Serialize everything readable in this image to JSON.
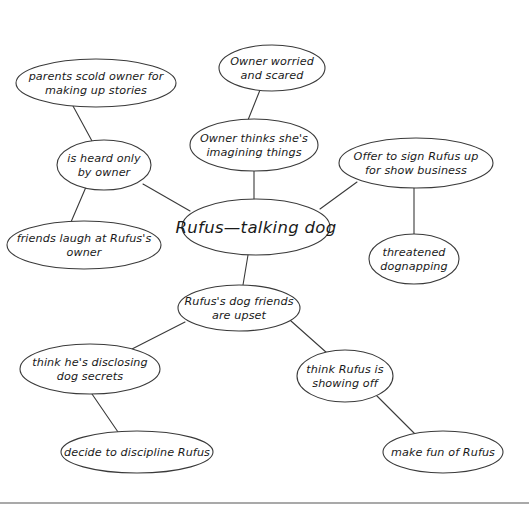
{
  "diagram": {
    "stroke_color": "#3a3a3a",
    "background_color": "#ffffff",
    "text_color": "#1a1a1a",
    "rule_color": "#555555",
    "center_node": {
      "id": "center",
      "label": "Rufus—talking dog",
      "lines": [
        "Rufus—talking dog"
      ],
      "cx": 256,
      "cy": 227,
      "rx": 74,
      "ry": 28
    },
    "nodes": [
      {
        "id": "parents-scold-owner",
        "label": "parents scold owner for making up stories",
        "lines": [
          "parents scold owner for",
          "making up stories"
        ],
        "cx": 96,
        "cy": 83,
        "rx": 80,
        "ry": 24
      },
      {
        "id": "owner-worried",
        "label": "Owner worried and scared",
        "lines": [
          "Owner worried",
          "and scared"
        ],
        "cx": 272,
        "cy": 68,
        "rx": 53,
        "ry": 23
      },
      {
        "id": "is-heard-only-by-owner",
        "label": "is heard only by owner",
        "lines": [
          "is heard only",
          "by owner"
        ],
        "cx": 104,
        "cy": 165,
        "rx": 47,
        "ry": 25
      },
      {
        "id": "owner-thinks-imagining",
        "label": "Owner thinks she's imagining things",
        "lines": [
          "Owner thinks she's",
          "imagining things"
        ],
        "cx": 254,
        "cy": 145,
        "rx": 64,
        "ry": 26
      },
      {
        "id": "offer-show-business",
        "label": "Offer to sign Rufus up for show business",
        "lines": [
          "Offer to sign Rufus up",
          "for show business"
        ],
        "cx": 416,
        "cy": 163,
        "rx": 77,
        "ry": 25
      },
      {
        "id": "friends-laugh",
        "label": "friends laugh at Rufus's owner",
        "lines": [
          "friends laugh at Rufus's",
          "owner"
        ],
        "cx": 84,
        "cy": 245,
        "rx": 77,
        "ry": 24
      },
      {
        "id": "threatened-dognapping",
        "label": "threatened dognapping",
        "rx": 45,
        "lines": [
          "threatened",
          "dognapping"
        ],
        "cx": 414,
        "cy": 259,
        "ry": 25
      },
      {
        "id": "dog-friends-upset",
        "label": "Rufus's dog friends are upset",
        "lines": [
          "Rufus's dog friends",
          "are upset"
        ],
        "cx": 239,
        "cy": 308,
        "rx": 61,
        "ry": 23
      },
      {
        "id": "disclosing-dog-secrets",
        "label": "think he's disclosing dog secrets",
        "lines": [
          "think he's disclosing",
          "dog secrets"
        ],
        "cx": 90,
        "cy": 369,
        "rx": 70,
        "ry": 25
      },
      {
        "id": "showing-off",
        "label": "think Rufus is showing off",
        "lines": [
          "think Rufus is",
          "showing off"
        ],
        "cx": 345,
        "cy": 376,
        "rx": 48,
        "ry": 26
      },
      {
        "id": "decide-discipline",
        "label": "decide to discipline Rufus",
        "lines": [
          "decide to discipline Rufus"
        ],
        "cx": 137,
        "cy": 452,
        "rx": 76,
        "ry": 21
      },
      {
        "id": "make-fun-of-rufus",
        "label": "make fun of Rufus",
        "lines": [
          "make fun of Rufus"
        ],
        "cx": 443,
        "cy": 452,
        "rx": 60,
        "ry": 21
      }
    ],
    "edges": [
      {
        "id": "edge-center-is-heard",
        "from": "center",
        "to": "is-heard-only-by-owner",
        "x1": 190,
        "y1": 211,
        "x2": 143,
        "y2": 184
      },
      {
        "id": "edge-is-heard-parents",
        "from": "is-heard-only-by-owner",
        "to": "parents-scold-owner",
        "x1": 92,
        "y1": 141,
        "x2": 73,
        "y2": 106
      },
      {
        "id": "edge-is-heard-friends",
        "from": "is-heard-only-by-owner",
        "to": "friends-laugh",
        "x1": 86,
        "y1": 187,
        "x2": 71,
        "y2": 222
      },
      {
        "id": "edge-center-owner-thinks",
        "from": "center",
        "to": "owner-thinks-imagining",
        "x1": 254,
        "y1": 199,
        "x2": 254,
        "y2": 171
      },
      {
        "id": "edge-owner-thinks-worried",
        "from": "owner-thinks-imagining",
        "to": "owner-worried",
        "x1": 248,
        "y1": 120,
        "x2": 260,
        "y2": 90
      },
      {
        "id": "edge-center-offer",
        "from": "center",
        "to": "offer-show-business",
        "x1": 320,
        "y1": 209,
        "x2": 357,
        "y2": 182
      },
      {
        "id": "edge-offer-dognapping",
        "from": "offer-show-business",
        "to": "threatened-dognapping",
        "x1": 414,
        "y1": 188,
        "x2": 414,
        "y2": 234
      },
      {
        "id": "edge-center-dog-friends",
        "from": "center",
        "to": "dog-friends-upset",
        "x1": 248,
        "y1": 255,
        "x2": 243,
        "y2": 285
      },
      {
        "id": "edge-dog-friends-disclosing",
        "from": "dog-friends-upset",
        "to": "disclosing-dog-secrets",
        "x1": 185,
        "y1": 322,
        "x2": 132,
        "y2": 349
      },
      {
        "id": "edge-dog-friends-showing-off",
        "from": "dog-friends-upset",
        "to": "showing-off",
        "x1": 291,
        "y1": 321,
        "x2": 327,
        "y2": 353
      },
      {
        "id": "edge-disclosing-decide",
        "from": "disclosing-dog-secrets",
        "to": "decide-discipline",
        "x1": 92,
        "y1": 394,
        "x2": 118,
        "y2": 432
      },
      {
        "id": "edge-showing-off-make-fun",
        "from": "showing-off",
        "to": "make-fun-of-rufus",
        "x1": 377,
        "y1": 396,
        "x2": 415,
        "y2": 434
      }
    ],
    "page_rule": {
      "y": 503,
      "x1": 0,
      "x2": 529
    }
  }
}
